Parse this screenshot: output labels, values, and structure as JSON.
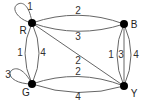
{
  "graph": {
    "nodes": [
      {
        "id": "R",
        "label": "R",
        "x": 32,
        "y": 23
      },
      {
        "id": "B",
        "label": "B",
        "x": 124,
        "y": 24
      },
      {
        "id": "G",
        "label": "G",
        "x": 32,
        "y": 84
      },
      {
        "id": "Y",
        "label": "Y",
        "x": 124,
        "y": 86
      }
    ],
    "edges": [
      {
        "from": "R",
        "to": "R",
        "label": "1",
        "type": "loop"
      },
      {
        "from": "G",
        "to": "G",
        "label": "3",
        "type": "loop"
      },
      {
        "from": "R",
        "to": "B",
        "label": "2",
        "type": "curve-up"
      },
      {
        "from": "R",
        "to": "B",
        "label": "3",
        "type": "curve-down"
      },
      {
        "from": "R",
        "to": "G",
        "label": "1",
        "type": "curve-left"
      },
      {
        "from": "R",
        "to": "G",
        "label": "4",
        "type": "curve-right"
      },
      {
        "from": "R",
        "to": "Y",
        "label": "2",
        "type": "straight"
      },
      {
        "from": "G",
        "to": "Y",
        "label": "2",
        "type": "curve-up"
      },
      {
        "from": "G",
        "to": "Y",
        "label": "4",
        "type": "curve-down"
      },
      {
        "from": "B",
        "to": "Y",
        "label": "1",
        "type": "curve-left"
      },
      {
        "from": "B",
        "to": "Y",
        "label": "3",
        "type": "straight"
      },
      {
        "from": "B",
        "to": "Y",
        "label": "4",
        "type": "curve-right"
      }
    ]
  },
  "labels": {
    "node_R": "R",
    "node_B": "B",
    "node_G": "G",
    "node_Y": "Y",
    "loop_R": "1",
    "loop_G": "3",
    "RB_top": "2",
    "RB_bottom": "3",
    "RG_left": "1",
    "RG_right": "4",
    "RY_diag": "2",
    "GY_top": "2",
    "GY_bottom": "4",
    "BY_left": "1",
    "BY_mid": "3",
    "BY_right": "4"
  }
}
